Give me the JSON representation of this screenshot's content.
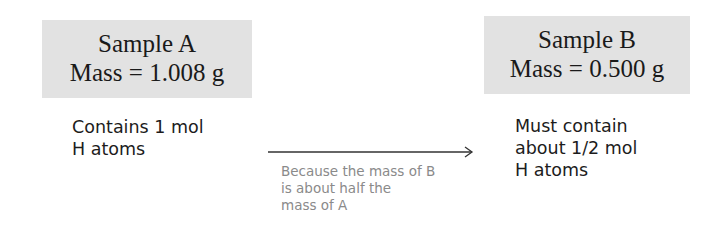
{
  "sample_a": {
    "title": "Sample A",
    "mass": "Mass = 1.008 g",
    "description_lines": [
      "Contains 1 mol",
      "H atoms"
    ]
  },
  "sample_b": {
    "title": "Sample B",
    "mass": "Mass = 0.500 g",
    "description_lines": [
      "Must contain",
      "about 1/2 mol",
      "H atoms"
    ]
  },
  "arrow": {
    "icon": "right-arrow-icon",
    "note_lines": [
      "Because the mass of B",
      "is about half the",
      "mass of A"
    ]
  },
  "colors": {
    "box_fill": "#e2e2e2",
    "text": "#1a1a1a",
    "note_text": "#8a8a8a",
    "arrow": "#333333"
  }
}
